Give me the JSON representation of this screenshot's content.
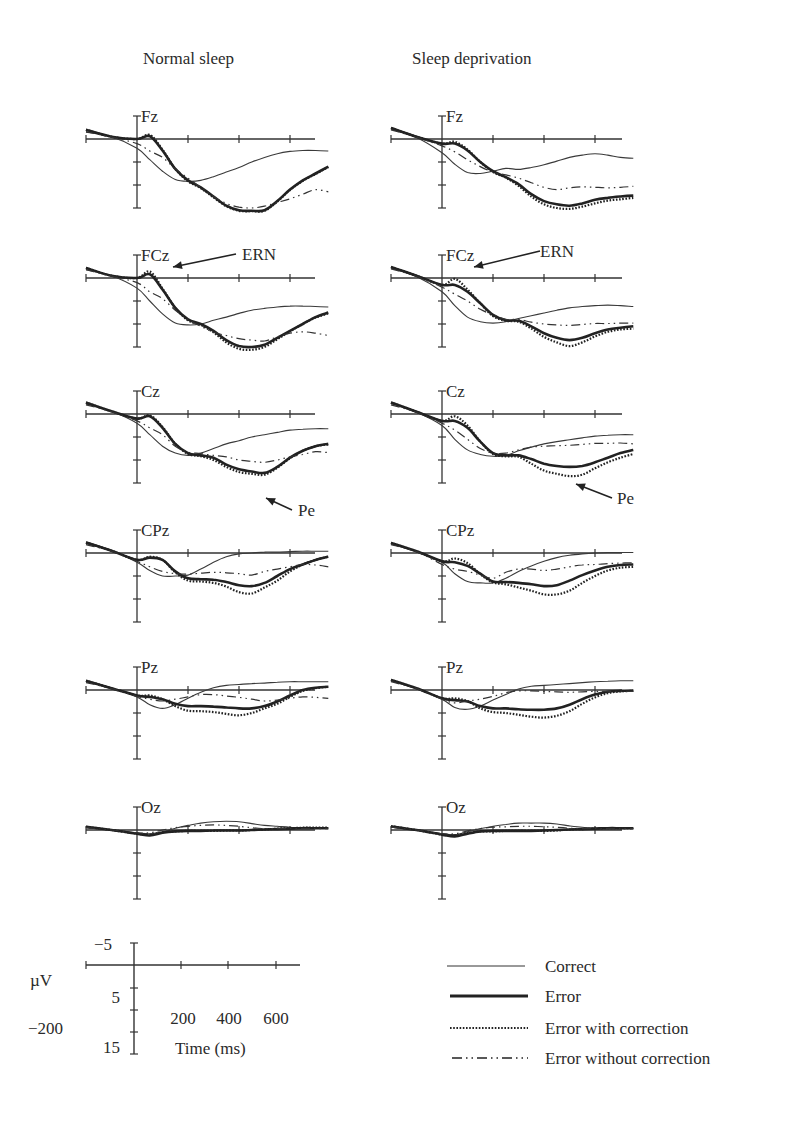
{
  "chart_data": {
    "type": "line",
    "title": "",
    "columns": [
      {
        "key": "normal",
        "title": "Normal sleep"
      },
      {
        "key": "deprived",
        "title": "Sleep deprivation"
      }
    ],
    "channels": [
      "Fz",
      "FCz",
      "Cz",
      "CPz",
      "Pz",
      "Oz"
    ],
    "xlabel": "Time (ms)",
    "ylabel": "µV",
    "x_ticks": [
      0,
      200,
      400,
      600
    ],
    "x_range": [
      -200,
      800
    ],
    "y_orientation": "negative up",
    "y_range": [
      -5,
      15
    ],
    "y_tick_step": 5,
    "scale_bar": {
      "y_labels": [
        "−5",
        "5",
        "15"
      ],
      "x_labels": [
        "200",
        "400",
        "600"
      ],
      "x_start_label": "−200",
      "unit_label": "µV",
      "time_label": "Time (ms)"
    },
    "annotations": [
      {
        "text": "ERN",
        "column": "normal",
        "channel": "FCz"
      },
      {
        "text": "ERN",
        "column": "deprived",
        "channel": "FCz"
      },
      {
        "text": "Pe",
        "column": "normal",
        "channel": "Cz"
      },
      {
        "text": "Pe",
        "column": "deprived",
        "channel": "Cz"
      }
    ],
    "legend": {
      "position": "bottom-right",
      "entries": [
        {
          "label": "Correct",
          "style": "thin-solid"
        },
        {
          "label": "Error",
          "style": "thick-solid"
        },
        {
          "label": "Error with correction",
          "style": "dotted"
        },
        {
          "label": "Error without correction",
          "style": "dash-dot"
        }
      ]
    },
    "x": [
      -200,
      -100,
      0,
      50,
      100,
      150,
      200,
      250,
      300,
      350,
      400,
      450,
      500,
      550,
      600,
      650,
      700,
      750
    ],
    "series": {
      "normal": {
        "Fz": {
          "Correct": [
            -1.5,
            -0.5,
            2.0,
            4.5,
            7.0,
            8.8,
            9.2,
            9.0,
            8.2,
            7.2,
            6.2,
            5.0,
            4.0,
            3.2,
            2.7,
            2.5,
            2.5,
            2.6
          ],
          "Error": [
            -2.0,
            -0.5,
            0.0,
            -0.6,
            2.5,
            6.5,
            9.0,
            10.5,
            12.5,
            14.5,
            15.5,
            15.6,
            15.5,
            13.5,
            11.0,
            9.0,
            7.5,
            6.0
          ],
          "Error with correction": [
            -2.0,
            -0.5,
            0.0,
            -0.9,
            2.3,
            6.5,
            9.2,
            10.7,
            12.7,
            14.6,
            15.6,
            15.7,
            15.6,
            13.6,
            11.1,
            9.1,
            7.6,
            6.1
          ],
          "Error without correction": [
            -1.6,
            -0.4,
            1.0,
            2.6,
            4.0,
            6.5,
            8.5,
            10.5,
            12.5,
            14.0,
            14.8,
            15.0,
            14.6,
            13.8,
            13.0,
            12.0,
            11.0,
            11.5
          ]
        },
        "FCz": {
          "Correct": [
            -1.8,
            -0.5,
            2.2,
            5.0,
            7.8,
            9.8,
            10.2,
            10.0,
            9.2,
            8.5,
            7.7,
            7.0,
            6.6,
            6.3,
            6.1,
            6.1,
            6.2,
            6.3
          ],
          "Error": [
            -2.2,
            -0.5,
            0.0,
            -0.8,
            2.5,
            6.5,
            9.0,
            10.0,
            11.5,
            13.5,
            14.8,
            15.0,
            14.5,
            13.0,
            11.5,
            10.0,
            8.5,
            7.5
          ],
          "Error with correction": [
            -2.2,
            -0.5,
            0.0,
            -1.4,
            2.3,
            6.5,
            9.2,
            10.2,
            11.8,
            14.0,
            15.4,
            15.6,
            15.0,
            13.3,
            11.6,
            10.0,
            8.6,
            7.7
          ],
          "Error without correction": [
            -1.8,
            -0.4,
            1.0,
            3.0,
            4.5,
            7.0,
            9.0,
            10.5,
            11.8,
            12.5,
            13.2,
            13.5,
            13.7,
            12.8,
            12.0,
            11.7,
            12.0,
            12.5
          ]
        },
        "Cz": {
          "Correct": [
            -2.2,
            -0.6,
            2.0,
            4.5,
            7.0,
            8.5,
            9.0,
            8.5,
            7.5,
            6.5,
            5.8,
            5.0,
            4.5,
            4.0,
            3.5,
            3.3,
            3.2,
            3.2
          ],
          "Error": [
            -2.5,
            -0.6,
            1.0,
            0.5,
            3.0,
            6.5,
            8.5,
            9.0,
            9.5,
            11.0,
            12.0,
            12.5,
            12.8,
            11.5,
            9.5,
            8.0,
            7.0,
            6.5
          ],
          "Error with correction": [
            -2.5,
            -0.6,
            1.0,
            0.3,
            2.8,
            6.5,
            8.7,
            9.2,
            10.0,
            11.5,
            12.6,
            13.0,
            13.2,
            11.7,
            9.6,
            8.0,
            7.0,
            6.6
          ],
          "Error without correction": [
            -2.0,
            -0.5,
            1.5,
            3.0,
            4.5,
            7.0,
            8.3,
            8.6,
            9.0,
            9.3,
            10.0,
            10.3,
            10.5,
            10.0,
            9.3,
            8.8,
            8.2,
            8.4
          ]
        },
        "CPz": {
          "Correct": [
            -2.0,
            -0.5,
            2.0,
            3.8,
            5.0,
            5.0,
            4.8,
            3.5,
            2.0,
            0.8,
            0.2,
            0.0,
            -0.2,
            -0.2,
            -0.3,
            -0.4,
            -0.4,
            -0.4
          ],
          "Error": [
            -2.3,
            -0.5,
            1.5,
            1.0,
            1.5,
            4.0,
            5.5,
            5.7,
            5.8,
            6.3,
            7.0,
            7.2,
            6.5,
            5.0,
            3.5,
            2.5,
            1.5,
            0.8
          ],
          "Error with correction": [
            -2.3,
            -0.5,
            1.5,
            0.8,
            1.5,
            4.2,
            6.0,
            6.2,
            6.5,
            7.3,
            8.5,
            8.8,
            7.5,
            6.0,
            4.0,
            2.5,
            1.5,
            0.8
          ],
          "Error without correction": [
            -1.8,
            -0.4,
            1.8,
            3.0,
            4.0,
            4.5,
            4.6,
            4.4,
            4.2,
            4.3,
            4.5,
            4.8,
            4.0,
            3.5,
            3.0,
            2.5,
            2.6,
            3.0
          ]
        },
        "Pz": {
          "Correct": [
            -1.8,
            -0.5,
            1.5,
            3.2,
            4.0,
            3.2,
            1.8,
            0.5,
            -0.5,
            -1.0,
            -1.2,
            -1.4,
            -1.5,
            -1.7,
            -1.8,
            -1.8,
            -1.8,
            -1.8
          ],
          "Error": [
            -2.0,
            -0.4,
            1.2,
            1.5,
            2.0,
            3.0,
            3.5,
            3.5,
            3.6,
            3.8,
            4.0,
            4.0,
            3.5,
            2.5,
            1.2,
            0.0,
            -0.5,
            -0.7
          ],
          "Error with correction": [
            -2.0,
            -0.4,
            1.2,
            1.2,
            2.0,
            3.5,
            4.5,
            4.6,
            4.8,
            5.2,
            5.5,
            5.0,
            4.0,
            3.0,
            1.5,
            0.2,
            -0.4,
            -0.7
          ],
          "Error without correction": [
            -1.6,
            -0.3,
            1.4,
            2.0,
            2.4,
            2.0,
            1.5,
            1.0,
            1.0,
            1.3,
            1.6,
            2.0,
            2.4,
            2.2,
            1.8,
            1.5,
            1.6,
            1.8
          ]
        },
        "Oz": {
          "Correct": [
            -0.5,
            0.0,
            0.6,
            0.8,
            0.4,
            -0.4,
            -1.0,
            -1.5,
            -1.8,
            -1.9,
            -1.8,
            -1.4,
            -1.0,
            -0.8,
            -0.6,
            -0.5,
            -0.5,
            -0.5
          ],
          "Error": [
            -0.7,
            0.0,
            0.8,
            1.2,
            0.6,
            0.3,
            0.2,
            0.2,
            0.1,
            0.1,
            0.1,
            0.0,
            -0.1,
            -0.2,
            -0.3,
            -0.4,
            -0.4,
            -0.4
          ],
          "Error with correction": [
            -0.7,
            0.0,
            0.8,
            1.0,
            0.5,
            0.3,
            0.2,
            0.2,
            0.2,
            0.1,
            0.1,
            0.0,
            -0.1,
            -0.3,
            -0.4,
            -0.5,
            -0.5,
            -0.5
          ],
          "Error without correction": [
            -0.5,
            0.0,
            0.6,
            0.6,
            0.0,
            -0.5,
            -0.8,
            -1.0,
            -1.1,
            -1.0,
            -0.8,
            -0.5,
            -0.3,
            -0.3,
            -0.3,
            -0.3,
            -0.3,
            -0.3
          ]
        }
      },
      "deprived": {
        "Fz": {
          "Correct": [
            -2.2,
            -0.3,
            3.0,
            5.5,
            7.3,
            7.5,
            7.0,
            6.4,
            6.6,
            6.2,
            5.6,
            4.8,
            4.0,
            3.5,
            3.2,
            3.5,
            4.0,
            4.2
          ],
          "Error": [
            -2.4,
            -0.5,
            1.0,
            1.0,
            2.5,
            5.0,
            7.0,
            8.3,
            9.8,
            12.0,
            13.5,
            14.2,
            14.5,
            14.0,
            13.2,
            12.8,
            12.5,
            12.3
          ],
          "Error with correction": [
            -2.4,
            -0.5,
            1.0,
            0.6,
            2.3,
            5.0,
            7.2,
            8.4,
            10.2,
            12.5,
            14.2,
            15.0,
            15.2,
            14.7,
            14.0,
            13.4,
            13.1,
            12.8
          ],
          "Error without correction": [
            -2.0,
            -0.4,
            1.5,
            2.8,
            4.5,
            6.0,
            7.2,
            7.8,
            8.5,
            9.5,
            10.5,
            11.0,
            10.6,
            10.4,
            10.5,
            10.6,
            10.5,
            10.3
          ]
        },
        "FCz": {
          "Correct": [
            -2.2,
            -0.3,
            3.0,
            6.0,
            8.5,
            9.5,
            9.8,
            9.5,
            8.8,
            8.2,
            7.6,
            7.0,
            6.5,
            6.2,
            6.0,
            5.9,
            6.0,
            6.2
          ],
          "Error": [
            -2.4,
            -0.5,
            1.5,
            1.5,
            3.0,
            5.5,
            8.0,
            9.2,
            9.3,
            10.5,
            12.0,
            13.0,
            13.5,
            13.0,
            12.0,
            11.2,
            10.8,
            10.5
          ],
          "Error with correction": [
            -2.4,
            -0.5,
            1.5,
            0.2,
            2.5,
            5.5,
            8.3,
            9.3,
            9.5,
            11.0,
            12.8,
            14.0,
            14.8,
            14.0,
            12.7,
            11.7,
            11.2,
            11.0
          ],
          "Error without correction": [
            -2.0,
            -0.4,
            2.0,
            3.5,
            5.0,
            6.8,
            8.0,
            9.0,
            9.0,
            9.6,
            10.0,
            10.2,
            10.3,
            10.1,
            9.9,
            9.9,
            9.8,
            9.8
          ]
        },
        "Cz": {
          "Correct": [
            -2.3,
            -0.4,
            2.5,
            5.5,
            7.8,
            8.8,
            9.2,
            9.0,
            8.0,
            7.2,
            6.5,
            6.0,
            5.6,
            5.2,
            4.8,
            4.6,
            4.5,
            4.5
          ],
          "Error": [
            -2.5,
            -0.5,
            1.5,
            1.5,
            3.0,
            6.0,
            8.5,
            9.0,
            9.0,
            9.8,
            10.8,
            11.3,
            11.5,
            11.3,
            10.5,
            9.5,
            8.5,
            7.8
          ],
          "Error with correction": [
            -2.5,
            -0.5,
            1.5,
            0.5,
            2.5,
            6.0,
            8.7,
            9.2,
            9.3,
            10.8,
            12.3,
            13.0,
            13.5,
            13.2,
            11.8,
            10.5,
            9.5,
            8.7
          ],
          "Error without correction": [
            -2.0,
            -0.4,
            2.0,
            3.5,
            5.5,
            7.5,
            8.5,
            8.5,
            7.8,
            7.2,
            7.0,
            6.9,
            6.8,
            6.6,
            6.4,
            6.4,
            6.3,
            6.5
          ]
        },
        "CPz": {
          "Correct": [
            -2.0,
            -0.3,
            2.0,
            4.5,
            6.2,
            6.5,
            6.5,
            5.5,
            4.0,
            2.8,
            1.8,
            1.0,
            0.5,
            0.2,
            0.0,
            -0.1,
            -0.1,
            -0.1
          ],
          "Error": [
            -2.2,
            -0.4,
            1.8,
            2.0,
            2.8,
            4.5,
            6.2,
            6.3,
            6.5,
            6.8,
            7.2,
            7.0,
            6.0,
            4.8,
            3.8,
            3.0,
            2.6,
            2.5
          ],
          "Error with correction": [
            -2.2,
            -0.4,
            1.8,
            1.2,
            2.2,
            4.6,
            6.4,
            6.8,
            7.5,
            8.2,
            9.0,
            9.0,
            8.2,
            6.5,
            5.0,
            3.8,
            3.2,
            3.0
          ],
          "Error without correction": [
            -1.8,
            -0.3,
            2.5,
            3.5,
            4.0,
            4.8,
            5.5,
            4.2,
            3.5,
            3.5,
            3.8,
            3.5,
            3.0,
            2.6,
            2.5,
            2.3,
            2.2,
            2.1
          ]
        },
        "Pz": {
          "Correct": [
            -2.0,
            -0.3,
            2.0,
            3.8,
            4.2,
            3.5,
            2.2,
            1.0,
            -0.2,
            -0.8,
            -1.0,
            -1.2,
            -1.4,
            -1.6,
            -1.8,
            -1.9,
            -2.0,
            -2.0
          ],
          "Error": [
            -2.2,
            -0.4,
            1.8,
            2.2,
            2.5,
            3.5,
            4.0,
            4.0,
            4.2,
            4.3,
            4.3,
            4.0,
            3.2,
            2.0,
            1.0,
            0.4,
            0.2,
            0.1
          ],
          "Error with correction": [
            -2.2,
            -0.4,
            1.8,
            1.8,
            2.4,
            4.0,
            4.8,
            5.0,
            5.4,
            5.8,
            6.0,
            5.6,
            4.6,
            3.0,
            1.6,
            0.7,
            0.3,
            0.2
          ],
          "Error without correction": [
            -1.8,
            -0.3,
            2.0,
            2.8,
            2.4,
            2.0,
            1.4,
            0.6,
            0.2,
            0.2,
            0.3,
            0.4,
            0.5,
            0.4,
            0.3,
            0.3,
            0.3,
            0.3
          ]
        },
        "Oz": {
          "Correct": [
            -0.6,
            0.0,
            0.8,
            1.0,
            0.4,
            -0.3,
            -0.8,
            -1.2,
            -1.5,
            -1.5,
            -1.5,
            -1.3,
            -0.9,
            -0.6,
            -0.4,
            -0.3,
            -0.3,
            -0.3
          ],
          "Error": [
            -0.8,
            0.0,
            1.0,
            1.4,
            0.8,
            0.3,
            0.2,
            0.2,
            0.2,
            0.2,
            0.1,
            0.0,
            -0.1,
            -0.2,
            -0.3,
            -0.4,
            -0.4,
            -0.4
          ],
          "Error with correction": [
            -0.8,
            0.0,
            1.0,
            1.2,
            0.7,
            0.3,
            0.3,
            0.2,
            0.2,
            0.2,
            0.2,
            0.1,
            -0.1,
            -0.2,
            -0.3,
            -0.4,
            -0.4,
            -0.4
          ],
          "Error without correction": [
            -0.6,
            0.0,
            0.8,
            0.8,
            0.2,
            -0.3,
            -0.6,
            -0.7,
            -0.8,
            -0.8,
            -0.7,
            -0.6,
            -0.4,
            -0.3,
            -0.3,
            -0.3,
            -0.3,
            -0.3
          ]
        }
      }
    }
  }
}
